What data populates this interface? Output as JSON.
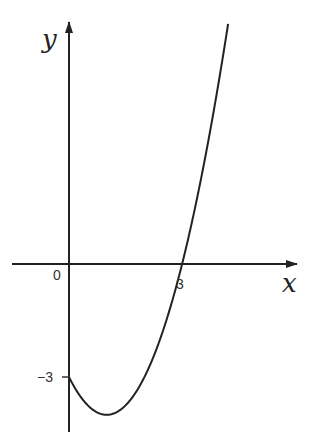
{
  "chart_data": {
    "type": "line",
    "title": "",
    "xlabel": "x",
    "ylabel": "y",
    "function": "y = x^2 - 2x - 3",
    "annotations": {
      "origin": "0",
      "x_intercept": "3",
      "y_intercept": "-3"
    },
    "key_points": [
      {
        "x": 0,
        "y": -3,
        "label": "-3"
      },
      {
        "x": 1,
        "y": -4,
        "label": "minimum"
      },
      {
        "x": 3,
        "y": 0,
        "label": "3"
      }
    ],
    "xlim": [
      -1.5,
      6.1
    ],
    "ylim": [
      -4.5,
      6.8
    ],
    "grid": false,
    "colors": {
      "curve": "#222222",
      "axes": "#222222"
    }
  },
  "labels": {
    "x_axis": "x",
    "y_axis": "y",
    "origin": "0",
    "x_tick_3": "3",
    "y_tick_neg3": "−3"
  }
}
